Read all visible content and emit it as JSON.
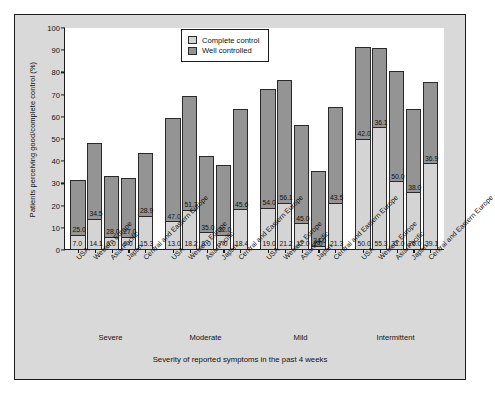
{
  "chart_data": {
    "type": "bar",
    "stacked": true,
    "title": "",
    "xlabel": "Severity of reported symptoms in the past 4 weeks",
    "ylabel": "Patients perceiving good/complete control (%)",
    "ylim": [
      0,
      100
    ],
    "yticks": [
      0,
      10,
      20,
      30,
      40,
      50,
      60,
      70,
      80,
      90,
      100
    ],
    "grid": false,
    "legend_position": "top-center",
    "legend": [
      {
        "label": "Complete control",
        "color": "#d4d4d4"
      },
      {
        "label": "Well controlled",
        "color": "#949494"
      }
    ],
    "categories": [
      "USA",
      "Western Europe",
      "Asia-Pacific",
      "Japan",
      "Central and Eastern Europe"
    ],
    "groups": [
      {
        "name": "Severe",
        "complete_control": [
          7.0,
          14.1,
          6.0,
          6.0,
          15.3
        ],
        "well_controlled": [
          25.0,
          34.5,
          28.0,
          27.0,
          28.9
        ],
        "totals": [
          32.0,
          48.6,
          34.0,
          33.0,
          44.2
        ]
      },
      {
        "name": "Moderate",
        "complete_control": [
          13.0,
          18.2,
          8.0,
          7.0,
          18.4
        ],
        "well_controlled": [
          47.0,
          51.7,
          35.0,
          32.0,
          45.6
        ],
        "totals": [
          60.0,
          69.9,
          43.0,
          39.0,
          64.0
        ]
      },
      {
        "name": "Mild",
        "complete_control": [
          19.0,
          21.2,
          12.0,
          2.0,
          21.3
        ],
        "well_controlled": [
          54.0,
          56.1,
          45.0,
          34.0,
          43.5
        ],
        "totals": [
          73.0,
          77.3,
          57.0,
          36.0,
          64.8
        ]
      },
      {
        "name": "Intermittent",
        "complete_control": [
          50.0,
          55.3,
          31.0,
          26.0,
          39.1
        ],
        "well_controlled": [
          42.0,
          36.1,
          50.0,
          38.0,
          36.9
        ],
        "totals": [
          92.0,
          91.4,
          81.0,
          64.0,
          76.0
        ]
      }
    ]
  }
}
